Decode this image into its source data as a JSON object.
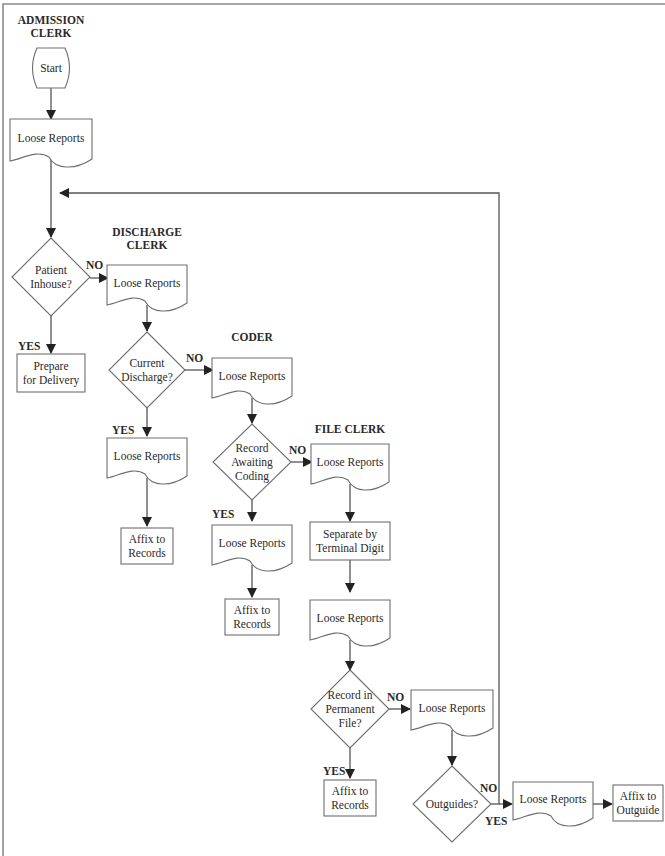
{
  "diagram": {
    "type": "flowchart",
    "lanes": {
      "admission": "ADMISSION CLERK",
      "discharge": "DISCHARGE CLERK",
      "coder": "CODER",
      "file": "FILE CLERK"
    },
    "nodes": {
      "start": {
        "kind": "terminal",
        "text": "Start"
      },
      "doc1": {
        "kind": "document",
        "text": "Loose Reports"
      },
      "dec_inhouse": {
        "kind": "decision",
        "text": "Patient Inhouse?"
      },
      "prepare": {
        "kind": "process",
        "text": "Prepare for Delivery"
      },
      "doc2": {
        "kind": "document",
        "text": "Loose Reports"
      },
      "dec_current": {
        "kind": "decision",
        "text": "Current Discharge?"
      },
      "doc3": {
        "kind": "document",
        "text": "Loose Reports"
      },
      "affix1": {
        "kind": "process",
        "text": "Affix to Records"
      },
      "doc4": {
        "kind": "document",
        "text": "Loose Reports"
      },
      "dec_awaiting": {
        "kind": "decision",
        "text": "Record Awaiting Coding"
      },
      "doc5": {
        "kind": "document",
        "text": "Loose Reports"
      },
      "affix2": {
        "kind": "process",
        "text": "Affix to Records"
      },
      "doc6": {
        "kind": "document",
        "text": "Loose Reports"
      },
      "separate": {
        "kind": "process",
        "text": "Separate by Terminal Digit"
      },
      "doc7": {
        "kind": "document",
        "text": "Loose Reports"
      },
      "dec_permanent": {
        "kind": "decision",
        "text": "Record in Permanent File?"
      },
      "affix3": {
        "kind": "process",
        "text": "Affix to Records"
      },
      "doc8": {
        "kind": "document",
        "text": "Loose Reports"
      },
      "dec_outguides": {
        "kind": "decision",
        "text": "Outguides?"
      },
      "doc9": {
        "kind": "document",
        "text": "Loose Reports"
      },
      "affix_out": {
        "kind": "process",
        "text": "Affix to Outguide"
      }
    },
    "edges": [
      {
        "from": "start",
        "to": "doc1",
        "label": ""
      },
      {
        "from": "doc1",
        "to": "dec_inhouse",
        "label": ""
      },
      {
        "from": "dec_inhouse",
        "to": "doc2",
        "label": "NO"
      },
      {
        "from": "dec_inhouse",
        "to": "prepare",
        "label": "YES"
      },
      {
        "from": "doc2",
        "to": "dec_current",
        "label": ""
      },
      {
        "from": "dec_current",
        "to": "doc4",
        "label": "NO"
      },
      {
        "from": "dec_current",
        "to": "doc3",
        "label": "YES"
      },
      {
        "from": "doc3",
        "to": "affix1",
        "label": ""
      },
      {
        "from": "doc4",
        "to": "dec_awaiting",
        "label": ""
      },
      {
        "from": "dec_awaiting",
        "to": "doc6",
        "label": "NO"
      },
      {
        "from": "dec_awaiting",
        "to": "doc5",
        "label": "YES"
      },
      {
        "from": "doc5",
        "to": "affix2",
        "label": ""
      },
      {
        "from": "doc6",
        "to": "separate",
        "label": ""
      },
      {
        "from": "separate",
        "to": "doc7",
        "label": ""
      },
      {
        "from": "doc7",
        "to": "dec_permanent",
        "label": ""
      },
      {
        "from": "dec_permanent",
        "to": "doc8",
        "label": "NO"
      },
      {
        "from": "dec_permanent",
        "to": "affix3",
        "label": "YES"
      },
      {
        "from": "doc8",
        "to": "dec_outguides",
        "label": ""
      },
      {
        "from": "dec_outguides",
        "to": "doc9",
        "label": "YES"
      },
      {
        "from": "dec_outguides",
        "to": "dec_inhouse",
        "label": "NO"
      },
      {
        "from": "doc9",
        "to": "affix_out",
        "label": ""
      }
    ],
    "branch_labels": {
      "yes": "YES",
      "no": "NO"
    }
  }
}
